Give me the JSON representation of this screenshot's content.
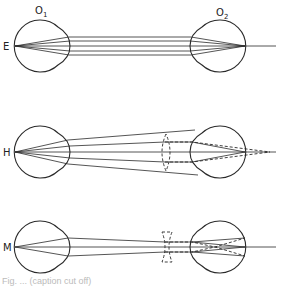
{
  "figure": {
    "panels": [
      {
        "id": "emmetropia",
        "label": "E",
        "eye_labels": [
          "O",
          "O"
        ],
        "eye_subscripts": [
          "1",
          "2"
        ]
      },
      {
        "id": "hypermetropia",
        "label": "H"
      },
      {
        "id": "myopia",
        "label": "M"
      }
    ],
    "caption": "Fig. ... (caption cut off)"
  }
}
